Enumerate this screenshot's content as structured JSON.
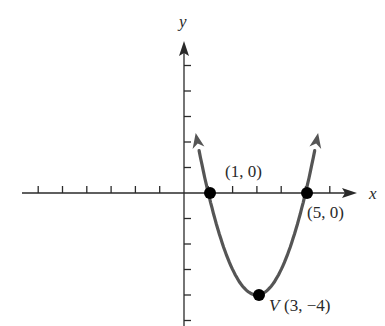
{
  "chart_data": {
    "type": "line",
    "title": "",
    "xlabel": "x",
    "ylabel": "y",
    "function": "y = (x - 1)(x - 5)",
    "x_ticks": [
      -6,
      -5,
      -4,
      -3,
      -2,
      -1,
      1,
      2,
      3,
      4,
      5,
      6
    ],
    "y_ticks": [
      -5,
      -4,
      -3,
      -2,
      -1,
      1,
      2,
      3,
      4,
      5
    ],
    "xlim": [
      -7.5,
      7
    ],
    "ylim": [
      -5,
      6
    ],
    "grid": false,
    "series": [
      {
        "name": "parabola",
        "x": [
          0.45,
          1,
          2,
          3,
          4,
          5,
          5.55
        ],
        "y": [
          2.6,
          0,
          -3,
          -4,
          -3,
          0,
          2.6
        ]
      }
    ],
    "points": [
      {
        "x": 1,
        "y": 0,
        "label": "(1, 0)"
      },
      {
        "x": 5,
        "y": 0,
        "label": "(5, 0)"
      },
      {
        "x": 3,
        "y": -4,
        "label": "V (3, −4)"
      }
    ],
    "annotations": {
      "x_intercept_left": "(1, 0)",
      "x_intercept_right": "(5, 0)",
      "vertex_prefix": "V",
      "vertex": "(3, −4)"
    },
    "colors": {
      "axis": "#2a2a2a",
      "curve": "#555555",
      "points": "#000000"
    }
  }
}
